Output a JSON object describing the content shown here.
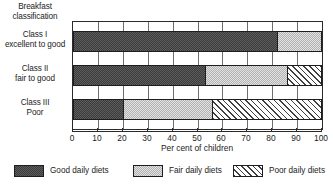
{
  "chart_data": {
    "type": "bar",
    "orientation": "horizontal",
    "stacked": true,
    "stacked_percent": true,
    "title": "",
    "axis_title_line1": "Breakfast",
    "axis_title_line2": "classification",
    "xlabel": "Per cent of children",
    "ylabel": "Breakfast classification",
    "xlim": [
      0,
      100
    ],
    "xticks": [
      0,
      10,
      20,
      30,
      40,
      50,
      60,
      70,
      80,
      90,
      100
    ],
    "xtick_labels": [
      "0",
      "10",
      "20",
      "30",
      "40",
      "50",
      "60",
      "70",
      "80",
      "90",
      "100"
    ],
    "grid": true,
    "grid_axis": "x",
    "legend_position": "bottom",
    "categories": [
      {
        "line1": "Class I",
        "line2": "excellent to good"
      },
      {
        "line1": "Class II",
        "line2": "fair to good"
      },
      {
        "line1": "Class III",
        "line2": "Poor"
      }
    ],
    "series": [
      {
        "name": "Good daily diets",
        "pattern": "dark-stipple",
        "color": "#4a4a4a",
        "values": [
          82,
          53,
          20
        ]
      },
      {
        "name": "Fair daily diets",
        "pattern": "light-checker",
        "color": "#c9c9c9",
        "values": [
          18,
          33,
          36
        ]
      },
      {
        "name": "Poor daily diets",
        "pattern": "diagonal-hatch",
        "color": "#ffffff",
        "values": [
          0,
          14,
          44
        ]
      }
    ],
    "segment_boundaries": [
      [
        0,
        82,
        100,
        100
      ],
      [
        0,
        53,
        86,
        100
      ],
      [
        0,
        20,
        56,
        100
      ]
    ],
    "legend": [
      {
        "label": "Good daily diets",
        "pattern": "dark-stipple"
      },
      {
        "label": "Fair daily diets",
        "pattern": "light-checker"
      },
      {
        "label": "Poor daily diets",
        "pattern": "diagonal-hatch"
      }
    ]
  }
}
